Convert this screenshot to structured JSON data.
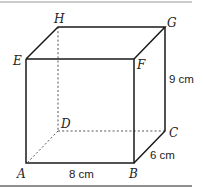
{
  "diagram": {
    "type": "cuboid",
    "vertices": {
      "A": "A",
      "B": "B",
      "C": "C",
      "D": "D",
      "E": "E",
      "F": "F",
      "G": "G",
      "H": "H"
    },
    "dimensions": {
      "length": "8 cm",
      "width": "6 cm",
      "height": "9 cm"
    },
    "colors": {
      "edge": "#1a1a1a",
      "hidden_edge": "#555555",
      "top_rule": "#9a9a9a",
      "bottom_rule": "#6a6a6a"
    }
  }
}
